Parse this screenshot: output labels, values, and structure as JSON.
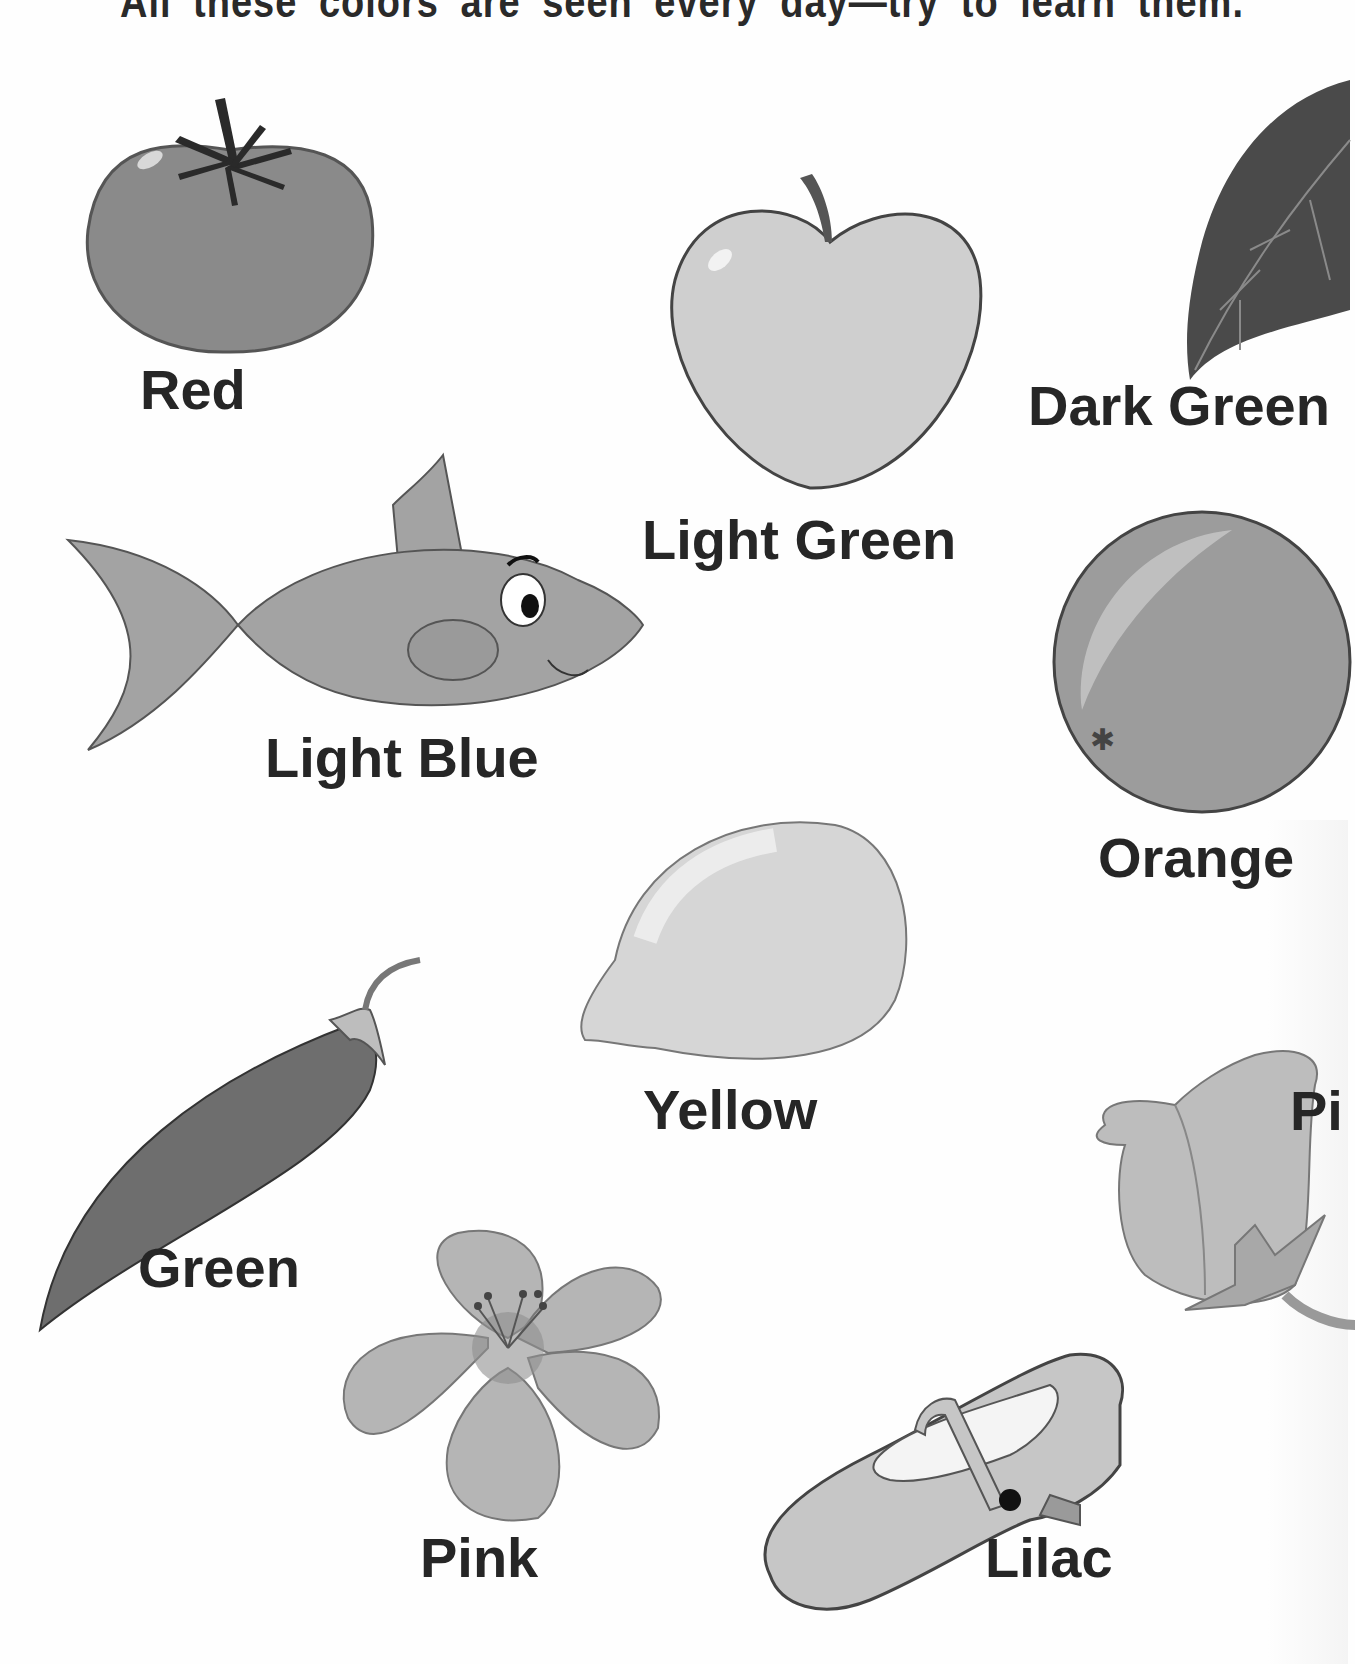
{
  "page": {
    "header": "All these colors are seen every day—try to learn them.",
    "image_mode": "grayscale scan",
    "background_color": "#fefefe",
    "text_color": "#262626"
  },
  "items": [
    {
      "label": "Red",
      "object": "tomato",
      "tone": "#8a8a8a"
    },
    {
      "label": "Light Green",
      "object": "apple",
      "tone": "#cfcfcf"
    },
    {
      "label": "Dark Green",
      "object": "leaf",
      "tone": "#4a4a4a",
      "note": "label truncated at right edge: 'Dark Greer'"
    },
    {
      "label": "Light Blue",
      "object": "fish",
      "tone": "#a3a3a3"
    },
    {
      "label": "Orange",
      "object": "orange",
      "tone": "#9c9c9c"
    },
    {
      "label": "Yellow",
      "object": "lemon",
      "tone": "#d6d6d6"
    },
    {
      "label": "Green",
      "object": "pea pod",
      "tone": "#6e6e6e"
    },
    {
      "label": "Pi",
      "object": "rose bud",
      "tone": "#bdbdbd",
      "note": "label truncated at right edge"
    },
    {
      "label": "Pink",
      "object": "flower",
      "tone": "#b5b5b5"
    },
    {
      "label": "Lilac",
      "object": "shoe",
      "tone": "#c6c6c6"
    }
  ]
}
